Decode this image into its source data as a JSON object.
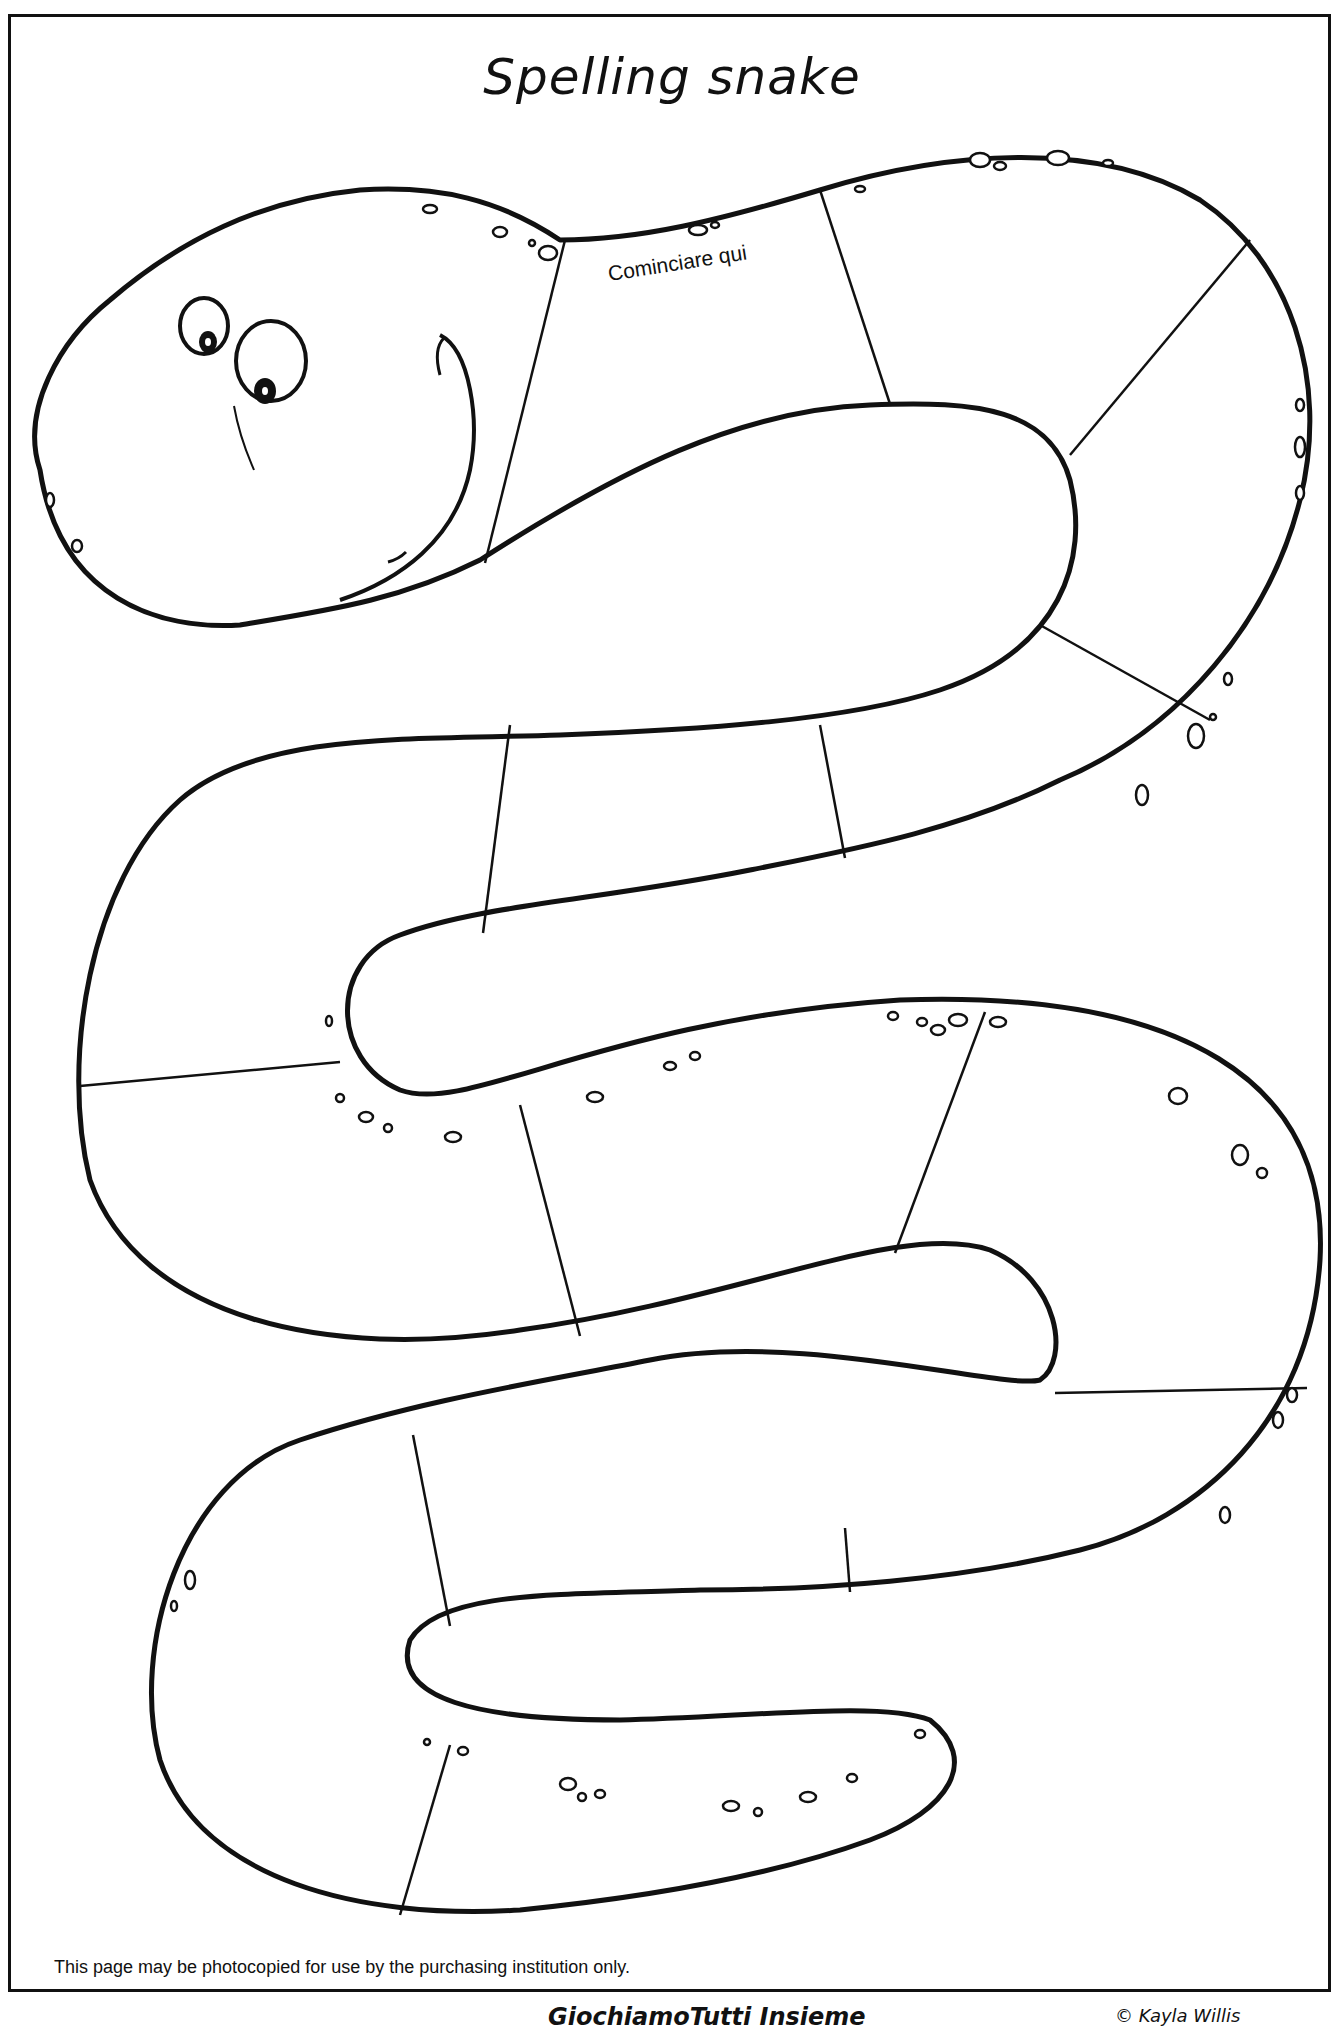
{
  "page": {
    "title": "Spelling snake",
    "start_label": "Cominciare qui",
    "photocopy_note": "This page may be photocopied for use by the purchasing institution only.",
    "footer_brand": "GiochiamoTutti Insieme",
    "footer_copyright": "© Kayla Willis"
  },
  "snake": {
    "segments_count": 20,
    "outline_color": "#111111",
    "fill_color": "#ffffff"
  }
}
